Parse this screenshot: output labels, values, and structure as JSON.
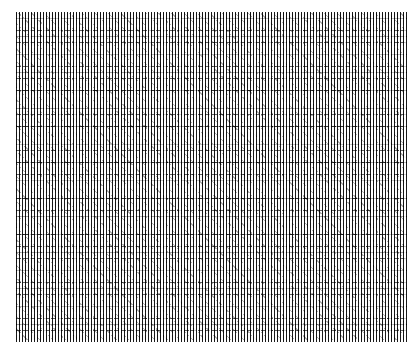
{
  "image": {
    "description": "Dense monochrome maze-like noise texture",
    "colors": {
      "background": "#ffffff",
      "ink": "#141414",
      "midtone": "#d8d8d8"
    }
  }
}
